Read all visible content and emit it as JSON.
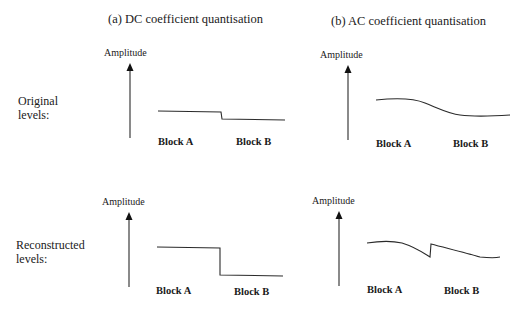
{
  "panels": {
    "dc": {
      "title": "(a) DC coefficient quantisation"
    },
    "ac": {
      "title": "(b) AC coefficient quantisation"
    }
  },
  "axis_label": "Amplitude",
  "rows": {
    "original": {
      "label_line1": "Original",
      "label_line2": "levels:"
    },
    "reconstructed": {
      "label_line1": "Reconstructed",
      "label_line2": "levels:"
    }
  },
  "blocks": {
    "a": "Block A",
    "b": "Block B"
  },
  "colors": {
    "line": "#2a2a2a",
    "text": "#1a1a1a",
    "background": "#ffffff"
  },
  "signals": {
    "dc_original": "Block A constant level, small step down at boundary, Block B constant lower level",
    "dc_reconstructed": "Block A constant level, large step down at boundary, Block B constant lower level",
    "ac_original": "Smooth continuous curve descending across blocks",
    "ac_reconstructed": "Curve with discontinuity (jump up) at block boundary"
  }
}
